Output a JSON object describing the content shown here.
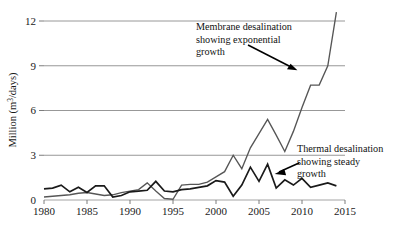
{
  "figure": {
    "background_color": "#ffffff",
    "membrane_color": "#565656",
    "thermal_color": "#1a1a1a",
    "grid_color": "#8c8c8c"
  },
  "annotations": {
    "membrane": {
      "line1": "Membrane desalination",
      "line2": "showing exponential",
      "line3": "growth"
    },
    "thermal": {
      "line1": "Thermal desalination",
      "line2": "showing steady",
      "line3": "growth"
    }
  },
  "axes": {
    "ylabel_prefix": "Million (m",
    "ylabel_sup": "3",
    "ylabel_suffix": "/days)",
    "ylabel_full": "Million (m3/days)",
    "yticks": [
      "0",
      "3",
      "6",
      "9",
      "12"
    ],
    "xticks": [
      "1980",
      "1985",
      "1990",
      "1995",
      "2000",
      "2005",
      "2010",
      "2015"
    ]
  },
  "chart_data": {
    "type": "line",
    "title": "",
    "xlabel": "",
    "ylabel": "Million (m3/days)",
    "xlim": [
      1980,
      2015
    ],
    "ylim": [
      0,
      13.2
    ],
    "yticks": [
      0,
      3,
      6,
      9,
      12
    ],
    "xticks": [
      1980,
      1985,
      1990,
      1995,
      2000,
      2005,
      2010,
      2015
    ],
    "grid": "horizontal",
    "legend": "none",
    "annotations": [
      {
        "text": "Membrane desalination showing exponential growth",
        "points_to_series": "Membrane desalination",
        "arrow_from_x": 2004.2,
        "arrow_from_y": 10.6,
        "arrow_to_x": 2011.4,
        "arrow_to_y": 8.6
      },
      {
        "text": "Thermal desalination showing steady growth",
        "points_to_series": "Thermal desalination",
        "arrow_from_x": 2010.2,
        "arrow_from_y": 1.9,
        "arrow_to_x": 2006.9,
        "arrow_to_y": 1.28
      }
    ],
    "x": [
      1980,
      1981,
      1982,
      1983,
      1984,
      1985,
      1986,
      1987,
      1988,
      1989,
      1990,
      1991,
      1992,
      1993,
      1994,
      1995,
      1996,
      1997,
      1998,
      1999,
      2000,
      2001,
      2002,
      2003,
      2004,
      2005,
      2006,
      2007,
      2008,
      2009,
      2010,
      2011,
      2012,
      2013,
      2014
    ],
    "series": [
      {
        "name": "Membrane desalination",
        "color": "#565656",
        "values": [
          0.2,
          0.25,
          0.3,
          0.35,
          0.45,
          0.5,
          0.4,
          0.3,
          0.35,
          0.5,
          0.6,
          0.7,
          1.15,
          0.6,
          0.1,
          0.05,
          1.0,
          1.05,
          1.05,
          1.2,
          1.55,
          1.9,
          3.0,
          2.1,
          3.5,
          4.45,
          5.4,
          4.35,
          3.25,
          4.6,
          6.2,
          7.7,
          7.7,
          9.0,
          12.6
        ]
      },
      {
        "name": "Thermal desalination",
        "color": "#1a1a1a",
        "values": [
          0.75,
          0.8,
          1.0,
          0.55,
          0.85,
          0.5,
          0.95,
          0.95,
          0.2,
          0.3,
          0.55,
          0.6,
          0.65,
          1.25,
          0.6,
          0.55,
          0.7,
          0.75,
          0.85,
          0.95,
          1.3,
          1.2,
          0.25,
          1.0,
          2.2,
          1.25,
          2.4,
          0.8,
          1.35,
          1.0,
          1.45,
          0.85,
          1.0,
          1.15,
          0.95
        ]
      }
    ]
  }
}
